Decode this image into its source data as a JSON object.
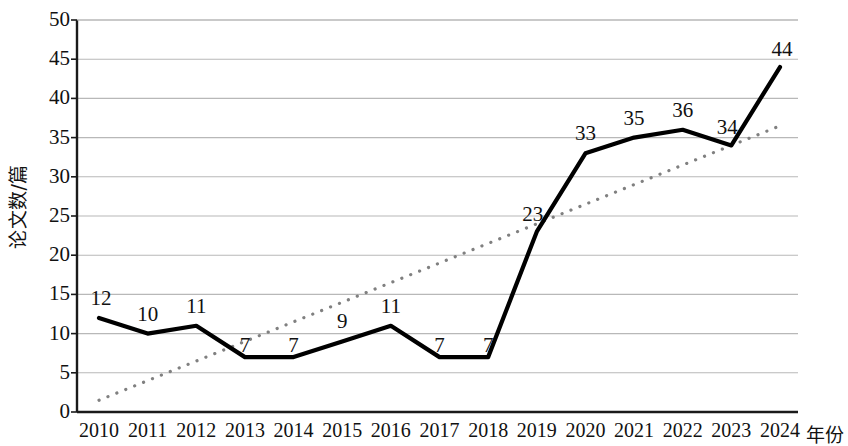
{
  "chart_data": {
    "type": "line",
    "title": "",
    "xlabel": "年份",
    "ylabel": "论文数/篇",
    "categories": [
      "2010",
      "2011",
      "2012",
      "2013",
      "2014",
      "2015",
      "2016",
      "2017",
      "2018",
      "2019",
      "2020",
      "2021",
      "2022",
      "2023",
      "2024"
    ],
    "series": [
      {
        "name": "论文数",
        "style": "solid",
        "color": "#000000",
        "values": [
          12,
          10,
          11,
          7,
          7,
          9,
          11,
          7,
          7,
          23,
          33,
          35,
          36,
          34,
          44
        ]
      },
      {
        "name": "趋势线",
        "style": "dotted",
        "color": "#808080",
        "values": [
          1.5,
          4.0,
          6.5,
          9.0,
          11.5,
          14.0,
          16.5,
          19.0,
          21.5,
          24.0,
          26.5,
          29.0,
          31.5,
          34.0,
          36.5
        ]
      }
    ],
    "data_labels": [
      "12",
      "10",
      "11",
      "7",
      "7",
      "9",
      "11",
      "7",
      "7",
      "23",
      "33",
      "35",
      "36",
      "34",
      "44"
    ],
    "yticks": [
      0,
      5,
      10,
      15,
      20,
      25,
      30,
      35,
      40,
      45,
      50
    ],
    "ytick_labels": [
      "0",
      "5",
      "10",
      "15",
      "20",
      "25",
      "30",
      "35",
      "40",
      "45",
      "50"
    ],
    "ylim": [
      0,
      50
    ],
    "grid": true,
    "grid_axis": "y",
    "legend": "none",
    "gridline_color": "#b8b8b8",
    "axis_color": "#1a1a1a",
    "background": "#ffffff"
  }
}
